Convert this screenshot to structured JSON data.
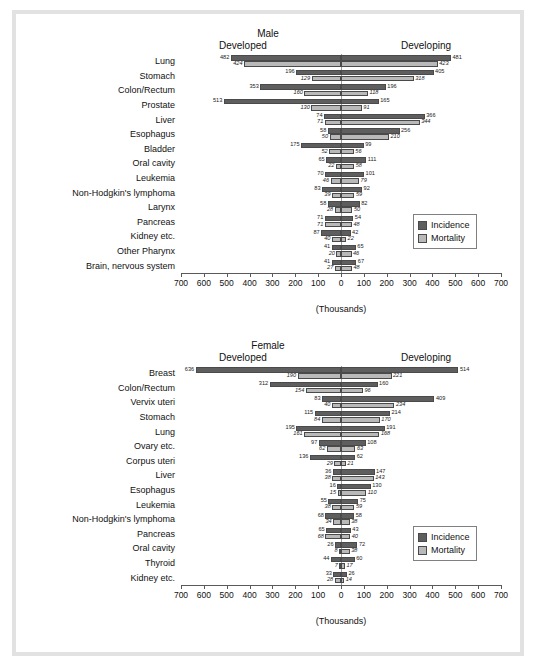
{
  "axis": {
    "caption": "(Thousands)",
    "ticks": [
      700,
      600,
      500,
      400,
      300,
      200,
      100,
      0,
      100,
      200,
      300,
      400,
      500,
      600,
      700
    ],
    "max": 700
  },
  "legend": {
    "incidence": "Incidence",
    "mortality": "Mortality"
  },
  "colors": {
    "incidence": "#5e5e5e",
    "mortality": "#b9b9b9",
    "frame": "#e2e2e2",
    "axis": "#5a5a5a"
  },
  "side_headers": {
    "left": "Developed",
    "right": "Developing"
  },
  "chart_data": [
    {
      "type": "bar",
      "title": "Male",
      "xlabel": "(Thousands)",
      "ylabel": "",
      "xlim": [
        -700,
        700
      ],
      "grid": false,
      "legend_position": "right-inside",
      "categories": [
        "Lung",
        "Stomach",
        "Colon/Rectum",
        "Prostate",
        "Liver",
        "Esophagus",
        "Bladder",
        "Oral cavity",
        "Leukemia",
        "Non-Hodgkin's lymphoma",
        "Larynx",
        "Pancreas",
        "Kidney etc.",
        "Other Pharynx",
        "Brain, nervous system"
      ],
      "series": [
        {
          "name": "Incidence",
          "developed": [
            482,
            196,
            353,
            513,
            74,
            58,
            175,
            65,
            70,
            83,
            58,
            71,
            87,
            41,
            41
          ],
          "developing": [
            481,
            405,
            196,
            165,
            366,
            256,
            99,
            111,
            101,
            92,
            82,
            54,
            42,
            65,
            67
          ]
        },
        {
          "name": "Mortality",
          "developed": [
            424,
            129,
            160,
            130,
            71,
            50,
            52,
            22,
            46,
            39,
            28,
            71,
            40,
            20,
            27
          ],
          "developing": [
            423,
            318,
            118,
            91,
            344,
            210,
            56,
            58,
            79,
            59,
            50,
            48,
            22,
            46,
            48
          ]
        }
      ]
    },
    {
      "type": "bar",
      "title": "Female",
      "xlabel": "(Thousands)",
      "ylabel": "",
      "xlim": [
        -700,
        700
      ],
      "grid": false,
      "legend_position": "right-inside",
      "categories": [
        "Breast",
        "Colon/Rectum",
        "Vervix uteri",
        "Stomach",
        "Lung",
        "Ovary etc.",
        "Corpus uteri",
        "Liver",
        "Esophagus",
        "Leukemia",
        "Non-Hodgkin's lymphoma",
        "Pancreas",
        "Oral cavity",
        "Thyroid",
        "Kidney etc."
      ],
      "series": [
        {
          "name": "Incidence",
          "developed": [
            636,
            312,
            83,
            115,
            195,
            97,
            136,
            36,
            16,
            55,
            68,
            65,
            26,
            44,
            33
          ],
          "developing": [
            514,
            160,
            409,
            214,
            191,
            108,
            62,
            147,
            130,
            75,
            58,
            43,
            72,
            60,
            26
          ]
        },
        {
          "name": "Mortality",
          "developed": [
            190,
            154,
            40,
            84,
            161,
            62,
            29,
            38,
            15,
            38,
            34,
            68,
            8,
            7,
            28
          ],
          "developing": [
            221,
            96,
            234,
            170,
            168,
            63,
            21,
            143,
            110,
            59,
            38,
            40,
            38,
            17,
            14
          ]
        }
      ]
    }
  ]
}
